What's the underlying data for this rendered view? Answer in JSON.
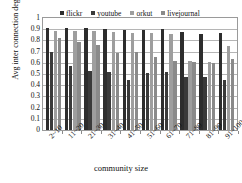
{
  "chart_data": {
    "type": "bar",
    "title": "",
    "xlabel": "community size",
    "ylabel": "Avg inter connection degree",
    "categories": [
      "2~10",
      "11~20",
      "21~30",
      "31~40",
      "41~50",
      "51~60",
      "61~70",
      "71~80",
      "81~90",
      "91~100"
    ],
    "ylim": [
      0,
      1
    ],
    "ytick_labels": [
      "1",
      "0.9",
      "0.8",
      "0.7",
      "0.6",
      "0.5",
      "0.4",
      "0.3",
      "0.2",
      "0.1",
      "0"
    ],
    "ytick_values": [
      1,
      0.9,
      0.8,
      0.7,
      0.6,
      0.5,
      0.4,
      0.3,
      0.2,
      0.1,
      0
    ],
    "grid": true,
    "legend_position": "top-inside",
    "series": [
      {
        "name": "flickr",
        "color": "#2d2d2d",
        "values": [
          0.91,
          0.91,
          0.91,
          0.9,
          0.89,
          0.89,
          0.905,
          0.875,
          0.855,
          0.865
        ]
      },
      {
        "name": "youtube",
        "color": "#3a3a3a",
        "values": [
          0.7,
          0.57,
          0.525,
          0.515,
          0.45,
          0.51,
          0.515,
          0.475,
          0.475,
          0.445
        ]
      },
      {
        "name": "orkut",
        "color": "#9e9e9e",
        "values": [
          0.885,
          0.885,
          0.885,
          0.875,
          0.865,
          0.87,
          0.86,
          0.62,
          0.605,
          0.75
        ]
      },
      {
        "name": "livejournal",
        "color": "#8a8a8a",
        "values": [
          0.825,
          0.79,
          0.755,
          0.685,
          0.695,
          0.655,
          0.62,
          0.605,
          0.6,
          0.635
        ]
      }
    ]
  }
}
